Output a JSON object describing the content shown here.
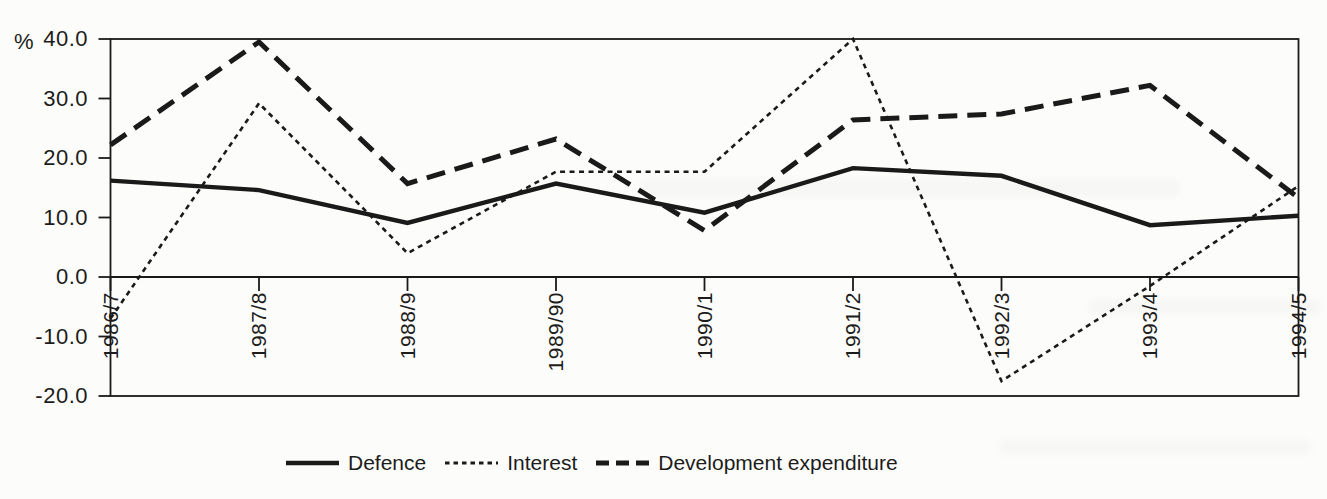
{
  "chart_data": {
    "type": "line",
    "title": "",
    "ylabel": "%",
    "xlabel": "",
    "grid": false,
    "legend_position": "bottom",
    "background_color": "#fcfcfa",
    "line_color": "#1a1a1a",
    "ylim": [
      -20,
      40
    ],
    "ytick_step": 10,
    "yticks": [
      {
        "value": 40,
        "label": "40.0"
      },
      {
        "value": 30,
        "label": "30.0"
      },
      {
        "value": 20,
        "label": "20.0"
      },
      {
        "value": 10,
        "label": "10.0"
      },
      {
        "value": 0,
        "label": "0.0"
      },
      {
        "value": -10,
        "label": "-10.0"
      },
      {
        "value": -20,
        "label": "-20.0"
      }
    ],
    "categories": [
      "1986/7",
      "1987/8",
      "1988/9",
      "1989/90",
      "1990/1",
      "1991/2",
      "1992/3",
      "1993/4",
      "1994/5"
    ],
    "series": [
      {
        "name": "Defence",
        "style": "solid",
        "values": [
          16.2,
          14.6,
          9.1,
          15.7,
          10.8,
          18.3,
          17.0,
          8.7,
          10.3
        ]
      },
      {
        "name": "Interest",
        "style": "dotted",
        "values": [
          -7.0,
          29.2,
          4.0,
          17.7,
          17.7,
          40.0,
          -17.5,
          -1.5,
          15.3
        ]
      },
      {
        "name": "Development expenditure",
        "style": "dashed",
        "values": [
          22.2,
          39.5,
          15.7,
          23.2,
          7.8,
          26.4,
          27.4,
          32.2,
          13.3
        ]
      }
    ]
  }
}
